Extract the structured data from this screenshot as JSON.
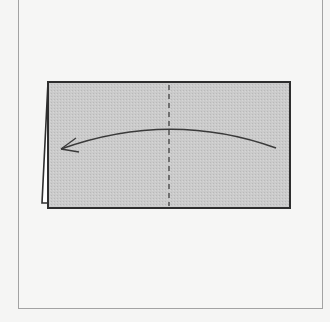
{
  "diagram": {
    "type": "origami-fold-step",
    "colors": {
      "background": "#f5f5f4",
      "frame_border": "#a3a3a3",
      "paper_fill": "#c9c9c9",
      "paper_back": "#ffffff",
      "outline": "#2e2e2e",
      "fold_line": "#4a4a4a",
      "arrow": "#3a3a3a"
    },
    "paper": {
      "front": {
        "x": 48,
        "y": 82,
        "width": 242,
        "height": 126
      },
      "back_flap": {
        "points": "48,82 42,203 48,203"
      }
    },
    "fold_line": {
      "style": "dashed",
      "x": 169,
      "y1": 84,
      "y2": 206
    },
    "arrow": {
      "direction": "right-to-left",
      "tail": [
        276,
        148
      ],
      "control": [
        170,
        112
      ],
      "tip": [
        61,
        149
      ]
    }
  }
}
